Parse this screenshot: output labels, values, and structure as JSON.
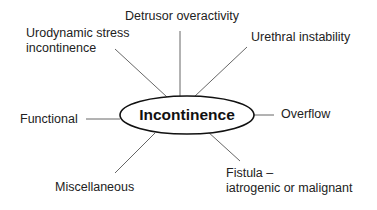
{
  "diagram": {
    "center": "Incontinence",
    "nodes": [
      {
        "id": "detrusor",
        "label": "Detrusor overactivity"
      },
      {
        "id": "urodynamic",
        "line1": "Urodynamic stress",
        "line2": "incontinence"
      },
      {
        "id": "urethral",
        "label": "Urethral instability"
      },
      {
        "id": "functional",
        "label": "Functional"
      },
      {
        "id": "overflow",
        "label": "Overflow"
      },
      {
        "id": "miscellaneous",
        "label": "Miscellaneous"
      },
      {
        "id": "fistula",
        "line1": "Fistula –",
        "line2": "iatrogenic or malignant"
      }
    ],
    "colors": {
      "line": "#555555",
      "ellipse": "#111111",
      "text": "#222222"
    }
  }
}
